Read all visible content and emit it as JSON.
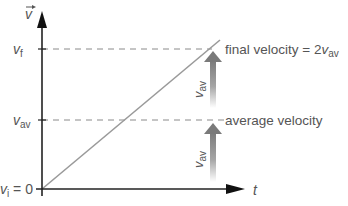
{
  "diagram": {
    "type": "velocity-time graph",
    "axes": {
      "y_label": "v",
      "y_label_has_vector_arrow": true,
      "x_label": "t"
    },
    "y_ticks": [
      {
        "symbol": "v",
        "subscript": "f",
        "suffix": ""
      },
      {
        "symbol": "v",
        "subscript": "av",
        "suffix": ""
      },
      {
        "symbol": "v",
        "subscript": "i",
        "suffix": " = 0"
      }
    ],
    "annotations": {
      "final": {
        "text": "final velocity = 2",
        "symbol": "v",
        "subscript": "av"
      },
      "average": {
        "text": "average velocity"
      }
    },
    "arrows": [
      {
        "label_symbol": "v",
        "label_subscript": "av",
        "position": "upper"
      },
      {
        "label_symbol": "v",
        "label_subscript": "av",
        "position": "lower"
      }
    ],
    "colors": {
      "axis": "#222222",
      "line": "#9a9a9a",
      "dashed": "#8a8a8a",
      "text": "#555555",
      "arrow_gradient_top": "#777777",
      "arrow_gradient_bottom": "#ffffff"
    }
  }
}
